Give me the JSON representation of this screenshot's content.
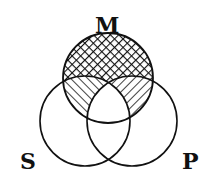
{
  "figure": {
    "type": "venn-diagram",
    "sets": [
      {
        "id": "M",
        "label": "M",
        "cx": 108,
        "cy": 78,
        "r": 45
      },
      {
        "id": "S",
        "label": "S",
        "cx": 85,
        "cy": 121,
        "r": 45
      },
      {
        "id": "P",
        "label": "P",
        "cx": 132,
        "cy": 121,
        "r": 45
      }
    ],
    "regions": [
      {
        "region": "M only (M - S - P)",
        "fill": "crosshatch"
      },
      {
        "region": "M ∩ S - P",
        "fill": "diagonal-hatch-backslash"
      },
      {
        "region": "M ∩ P - S",
        "fill": "diagonal-hatch-slash"
      },
      {
        "region": "M ∩ S ∩ P",
        "fill": "none"
      },
      {
        "region": "S only",
        "fill": "none"
      },
      {
        "region": "P only",
        "fill": "none"
      },
      {
        "region": "S ∩ P - M",
        "fill": "none"
      }
    ],
    "colors": {
      "stroke": "#111111",
      "background": "#ffffff"
    }
  },
  "labels": {
    "m": "M",
    "s": "S",
    "p": "P"
  }
}
